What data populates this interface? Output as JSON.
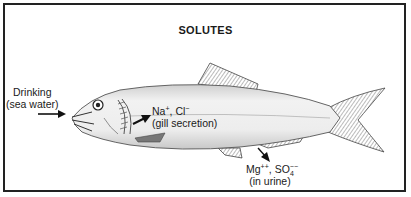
{
  "figure": {
    "title": "SOLUTES",
    "labels": {
      "drinking": {
        "line1": "Drinking",
        "line2": "(sea water)"
      },
      "gill": {
        "ion1": "Na",
        "ion1_charge": "+",
        "sep": ", ",
        "ion2": "Cl",
        "ion2_charge": "−",
        "line2": "(gill secretion)"
      },
      "urine": {
        "ion1": "Mg",
        "ion1_charge": "++",
        "sep": ", ",
        "ion2": "SO",
        "ion2_sub": "4",
        "ion2_charge": "−−",
        "line2": "(in urine)"
      }
    },
    "colors": {
      "ink": "#1a1a1a",
      "fish_body": "#e6e6e6",
      "fin_hatch": "#8a8a8a",
      "border": "#222222"
    }
  }
}
